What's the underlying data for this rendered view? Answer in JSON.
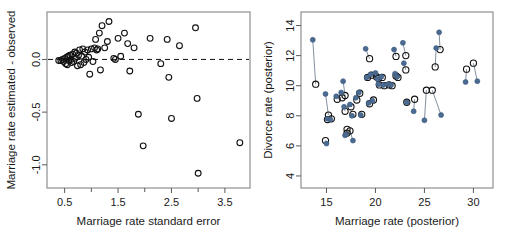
{
  "figure": {
    "panel_count": 2,
    "background": "#ffffff"
  },
  "colors": {
    "frame": "#8f8f8f",
    "open_point": "#111111",
    "filled_point": "#4a6a91",
    "pair_line": "#6b7b8c",
    "zero_line": "#111111",
    "text": "#1a1a1a"
  },
  "chart_data": [
    {
      "type": "scatter",
      "panel": "left",
      "title": "",
      "xlabel": "Marriage rate standard error",
      "ylabel": "Marriage rate estimated - observed",
      "xlim": [
        0.17,
        3.97
      ],
      "ylim": [
        -1.22,
        0.45
      ],
      "xticks": [
        0.5,
        1.5,
        2.5,
        3.5
      ],
      "xtick_labels": [
        "0.5",
        "1.5",
        "2.5",
        "3.5"
      ],
      "yticks": [
        -1.0,
        -0.5,
        0.0
      ],
      "ytick_labels": [
        "-1.0",
        "-0.5",
        "0.0"
      ],
      "grid": false,
      "legend": "none",
      "annotations": [
        {
          "type": "hline",
          "y": 0.0,
          "style": "dashed"
        }
      ],
      "marker": "open-circle",
      "points": [
        {
          "x": 0.39,
          "y": -0.01
        },
        {
          "x": 0.43,
          "y": -0.01
        },
        {
          "x": 0.46,
          "y": 0.0
        },
        {
          "x": 0.48,
          "y": -0.02
        },
        {
          "x": 0.5,
          "y": 0.01
        },
        {
          "x": 0.52,
          "y": -0.04
        },
        {
          "x": 0.54,
          "y": 0.02
        },
        {
          "x": 0.55,
          "y": -0.05
        },
        {
          "x": 0.57,
          "y": 0.03
        },
        {
          "x": 0.58,
          "y": -0.01
        },
        {
          "x": 0.6,
          "y": 0.04
        },
        {
          "x": 0.62,
          "y": 0.0
        },
        {
          "x": 0.63,
          "y": -0.03
        },
        {
          "x": 0.65,
          "y": 0.05
        },
        {
          "x": 0.67,
          "y": -0.02
        },
        {
          "x": 0.69,
          "y": 0.07
        },
        {
          "x": 0.7,
          "y": 0.01
        },
        {
          "x": 0.72,
          "y": 0.06
        },
        {
          "x": 0.74,
          "y": -0.06
        },
        {
          "x": 0.76,
          "y": 0.04
        },
        {
          "x": 0.78,
          "y": 0.09
        },
        {
          "x": 0.8,
          "y": -0.05
        },
        {
          "x": 0.82,
          "y": 0.03
        },
        {
          "x": 0.84,
          "y": 0.1
        },
        {
          "x": 0.86,
          "y": -0.03
        },
        {
          "x": 0.88,
          "y": 0.07
        },
        {
          "x": 0.9,
          "y": 0.0
        },
        {
          "x": 0.93,
          "y": 0.09
        },
        {
          "x": 0.95,
          "y": 0.02
        },
        {
          "x": 0.97,
          "y": -0.14
        },
        {
          "x": 1.0,
          "y": 0.1
        },
        {
          "x": 1.03,
          "y": -0.02
        },
        {
          "x": 1.06,
          "y": 0.11
        },
        {
          "x": 1.08,
          "y": 0.19
        },
        {
          "x": 1.1,
          "y": 0.09
        },
        {
          "x": 1.12,
          "y": 0.1
        },
        {
          "x": 1.15,
          "y": 0.25
        },
        {
          "x": 1.17,
          "y": -0.1
        },
        {
          "x": 1.2,
          "y": 0.32
        },
        {
          "x": 1.25,
          "y": 0.11
        },
        {
          "x": 1.3,
          "y": 0.17
        },
        {
          "x": 1.33,
          "y": 0.36
        },
        {
          "x": 1.42,
          "y": 0.01
        },
        {
          "x": 1.45,
          "y": 0.0
        },
        {
          "x": 1.5,
          "y": 0.2
        },
        {
          "x": 1.55,
          "y": 0.03
        },
        {
          "x": 1.62,
          "y": 0.25
        },
        {
          "x": 1.68,
          "y": 0.15
        },
        {
          "x": 1.72,
          "y": -0.11
        },
        {
          "x": 1.8,
          "y": 0.11
        },
        {
          "x": 1.88,
          "y": -0.52
        },
        {
          "x": 1.97,
          "y": -0.82
        },
        {
          "x": 2.1,
          "y": 0.2
        },
        {
          "x": 2.3,
          "y": -0.04
        },
        {
          "x": 2.42,
          "y": 0.19
        },
        {
          "x": 2.45,
          "y": -0.17
        },
        {
          "x": 2.5,
          "y": -0.56
        },
        {
          "x": 2.65,
          "y": 0.13
        },
        {
          "x": 2.95,
          "y": 0.3
        },
        {
          "x": 2.98,
          "y": -0.37
        },
        {
          "x": 3.0,
          "y": -1.08
        },
        {
          "x": 3.78,
          "y": -0.79
        }
      ]
    },
    {
      "type": "scatter",
      "panel": "right",
      "title": "",
      "xlabel": "Marriage rate (posterior)",
      "ylabel": "Divorce rate (posterior)",
      "xlim": [
        12.4,
        32.0
      ],
      "ylim": [
        3.2,
        14.9
      ],
      "xticks": [
        15,
        20,
        25,
        30
      ],
      "xtick_labels": [
        "15",
        "20",
        "25",
        "30"
      ],
      "yticks": [
        4,
        6,
        8,
        10,
        12,
        14
      ],
      "ytick_labels": [
        "4",
        "6",
        "8",
        "10",
        "12",
        "14"
      ],
      "grid": false,
      "legend": "none",
      "series": [
        {
          "name": "observed",
          "marker": "filled-circle",
          "color": "#4a6a91"
        },
        {
          "name": "estimated",
          "marker": "open-circle",
          "color": "#111111"
        }
      ],
      "pairs": [
        {
          "x_obs": 13.6,
          "y_obs": 13.05,
          "x_est": 13.9,
          "y_est": 10.1
        },
        {
          "x_obs": 14.9,
          "y_obs": 9.45,
          "x_est": 15.2,
          "y_est": 8.05
        },
        {
          "x_obs": 15.1,
          "y_obs": 7.8,
          "x_est": 15.1,
          "y_est": 7.75
        },
        {
          "x_obs": 15.0,
          "y_obs": 6.15,
          "x_est": 14.9,
          "y_est": 6.35
        },
        {
          "x_obs": 15.4,
          "y_obs": 7.75,
          "x_est": 15.5,
          "y_est": 7.8
        },
        {
          "x_obs": 16.0,
          "y_obs": 9.3,
          "x_est": 16.1,
          "y_est": 9.1
        },
        {
          "x_obs": 16.5,
          "y_obs": 9.55,
          "x_est": 16.6,
          "y_est": 9.2
        },
        {
          "x_obs": 16.7,
          "y_obs": 10.3,
          "x_est": 16.9,
          "y_est": 9.35
        },
        {
          "x_obs": 16.8,
          "y_obs": 8.6,
          "x_est": 16.9,
          "y_est": 8.3
        },
        {
          "x_obs": 16.9,
          "y_obs": 6.7,
          "x_est": 17.1,
          "y_est": 7.1
        },
        {
          "x_obs": 17.0,
          "y_obs": 6.75,
          "x_est": 17.1,
          "y_est": 6.85
        },
        {
          "x_obs": 17.4,
          "y_obs": 8.75,
          "x_est": 17.5,
          "y_est": 8.6
        },
        {
          "x_obs": 17.6,
          "y_obs": 8.0,
          "x_est": 17.7,
          "y_est": 8.1
        },
        {
          "x_obs": 17.7,
          "y_obs": 6.35,
          "x_est": 17.4,
          "y_est": 7.0
        },
        {
          "x_obs": 18.0,
          "y_obs": 9.2,
          "x_est": 18.1,
          "y_est": 9.05
        },
        {
          "x_obs": 18.3,
          "y_obs": 9.55,
          "x_est": 18.4,
          "y_est": 9.5
        },
        {
          "x_obs": 18.5,
          "y_obs": 8.05,
          "x_est": 18.6,
          "y_est": 8.1
        },
        {
          "x_obs": 19.0,
          "y_obs": 12.45,
          "x_est": 19.4,
          "y_est": 11.8
        },
        {
          "x_obs": 19.1,
          "y_obs": 10.55,
          "x_est": 19.2,
          "y_est": 10.55
        },
        {
          "x_obs": 19.3,
          "y_obs": 8.85,
          "x_est": 19.4,
          "y_est": 8.8
        },
        {
          "x_obs": 19.5,
          "y_obs": 10.75,
          "x_est": 19.6,
          "y_est": 10.7
        },
        {
          "x_obs": 19.7,
          "y_obs": 9.0,
          "x_est": 19.8,
          "y_est": 9.05
        },
        {
          "x_obs": 20.0,
          "y_obs": 10.85,
          "x_est": 20.1,
          "y_est": 10.6
        },
        {
          "x_obs": 20.2,
          "y_obs": 10.45,
          "x_est": 20.3,
          "y_est": 10.5
        },
        {
          "x_obs": 20.3,
          "y_obs": 10.1,
          "x_est": 20.4,
          "y_est": 10.05
        },
        {
          "x_obs": 20.6,
          "y_obs": 10.6,
          "x_est": 20.7,
          "y_est": 10.55
        },
        {
          "x_obs": 20.8,
          "y_obs": 10.05,
          "x_est": 20.9,
          "y_est": 10.0
        },
        {
          "x_obs": 21.3,
          "y_obs": 10.1,
          "x_est": 21.4,
          "y_est": 10.05
        },
        {
          "x_obs": 21.6,
          "y_obs": 10.05,
          "x_est": 21.7,
          "y_est": 10.0
        },
        {
          "x_obs": 21.9,
          "y_obs": 12.4,
          "x_est": 22.1,
          "y_est": 11.95
        },
        {
          "x_obs": 22.0,
          "y_obs": 10.8,
          "x_est": 22.1,
          "y_est": 10.65
        },
        {
          "x_obs": 22.2,
          "y_obs": 10.6,
          "x_est": 22.3,
          "y_est": 10.55
        },
        {
          "x_obs": 22.8,
          "y_obs": 12.85,
          "x_est": 23.1,
          "y_est": 12.0
        },
        {
          "x_obs": 22.9,
          "y_obs": 11.5,
          "x_est": 23.1,
          "y_est": 11.05
        },
        {
          "x_obs": 23.2,
          "y_obs": 8.9,
          "x_est": 23.2,
          "y_est": 8.9
        },
        {
          "x_obs": 23.9,
          "y_obs": 8.3,
          "x_est": 24.0,
          "y_est": 9.1
        },
        {
          "x_obs": 25.0,
          "y_obs": 7.7,
          "x_est": 25.2,
          "y_est": 9.7
        },
        {
          "x_obs": 26.2,
          "y_obs": 12.5,
          "x_est": 26.1,
          "y_est": 11.25
        },
        {
          "x_obs": 26.5,
          "y_obs": 13.55,
          "x_est": 26.6,
          "y_est": 12.4
        },
        {
          "x_obs": 26.7,
          "y_obs": 8.05,
          "x_est": 25.8,
          "y_est": 9.7
        },
        {
          "x_obs": 29.2,
          "y_obs": 10.25,
          "x_est": 29.3,
          "y_est": 11.1
        },
        {
          "x_obs": 30.4,
          "y_obs": 10.3,
          "x_est": 30.0,
          "y_est": 11.5
        }
      ]
    }
  ]
}
